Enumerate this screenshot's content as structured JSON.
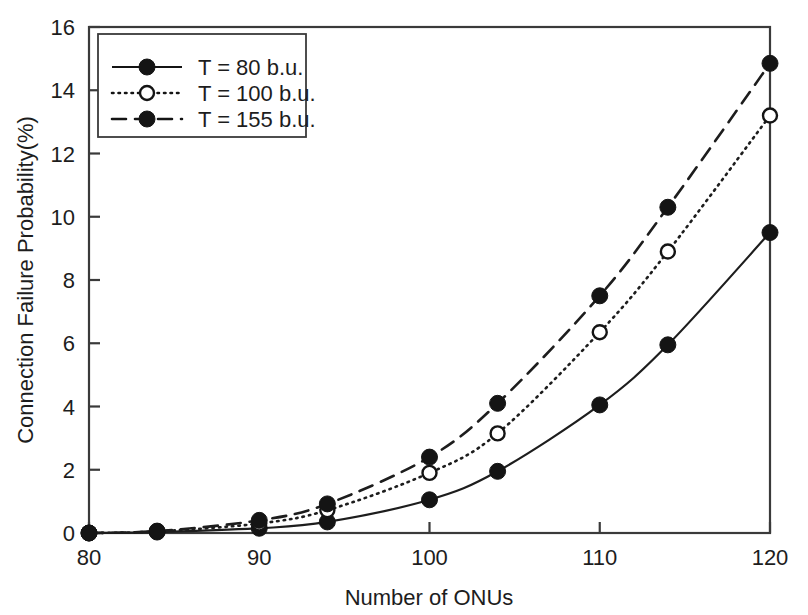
{
  "chart_data": {
    "type": "line",
    "title": "",
    "xlabel": "Number of ONUs",
    "ylabel": "Connection Failure Probability(%)",
    "xlim": [
      80,
      120
    ],
    "ylim": [
      0,
      16
    ],
    "xticks": [
      80,
      90,
      100,
      110,
      120
    ],
    "yticks": [
      0,
      2,
      4,
      6,
      8,
      10,
      12,
      14,
      16
    ],
    "xtick_labels": [
      "80",
      "90",
      "100",
      "110",
      "120"
    ],
    "ytick_labels": [
      "0",
      "2",
      "4",
      "6",
      "8",
      "10",
      "12",
      "14",
      "16"
    ],
    "grid": false,
    "legend_position": "upper left",
    "x": [
      80,
      84,
      90,
      94,
      100,
      104,
      110,
      114,
      120
    ],
    "series": [
      {
        "name": "T = 80 b.u.",
        "linestyle": "solid",
        "marker": "filled-circle",
        "color": "#141414",
        "values": [
          0.0,
          0.03,
          0.15,
          0.35,
          1.05,
          1.95,
          4.05,
          5.95,
          9.5
        ]
      },
      {
        "name": "T = 100 b.u.",
        "linestyle": "dotted",
        "marker": "open-circle",
        "color": "#141414",
        "values": [
          0.0,
          0.05,
          0.3,
          0.72,
          1.9,
          3.15,
          6.35,
          8.9,
          13.2
        ]
      },
      {
        "name": "T = 155 b.u.",
        "linestyle": "dashed",
        "marker": "filled-circle",
        "color": "#141414",
        "values": [
          0.0,
          0.06,
          0.4,
          0.92,
          2.4,
          4.1,
          7.5,
          10.3,
          14.85
        ]
      }
    ],
    "legend_entries": [
      "T = 80 b.u.",
      "T = 100 b.u.",
      "T = 155 b.u."
    ]
  }
}
